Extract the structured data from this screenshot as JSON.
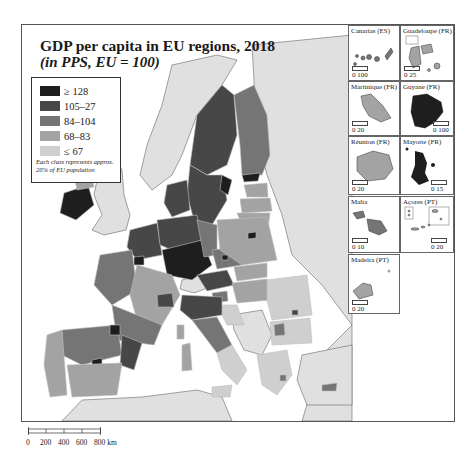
{
  "map": {
    "title": "GDP per capita in EU regions, 2018",
    "subtitle": "(in PPS, EU = 100)",
    "legend": {
      "classes": [
        {
          "label": "≥ 128",
          "color": "#1e1e1e"
        },
        {
          "label": "105–27",
          "color": "#474747"
        },
        {
          "label": "84–104",
          "color": "#757575"
        },
        {
          "label": "68–83",
          "color": "#a3a3a3"
        },
        {
          "label": "≤ 67",
          "color": "#cfcfcf"
        }
      ],
      "note": "Each class represents approx. 20% of EU population"
    },
    "non_eu_color": "#e0e0e0",
    "sea_color": "#ffffff",
    "insets": [
      {
        "name": "Canarias (ES)",
        "scale_label": "0 100",
        "fill": "#757575"
      },
      {
        "name": "Guadeloupe (FR)",
        "scale_label": "0 25",
        "fill": "#a3a3a3"
      },
      {
        "name": "Martinique (FR)",
        "scale_label": "0 20",
        "fill": "#a3a3a3"
      },
      {
        "name": "Guyane (FR)",
        "scale_label": "0 100",
        "fill": "#1e1e1e"
      },
      {
        "name": "Réunion (FR)",
        "scale_label": "0 20",
        "fill": "#a3a3a3"
      },
      {
        "name": "Mayotte (FR)",
        "scale_label": "0 15",
        "fill": "#1e1e1e"
      },
      {
        "name": "Malta",
        "scale_label": "0 10",
        "fill": "#757575"
      },
      {
        "name": "Açores (PT)",
        "scale_label": "0 20",
        "fill": "#a3a3a3"
      },
      {
        "name": "Madeira (PT)",
        "scale_label": "0 20",
        "fill": "#a3a3a3"
      }
    ],
    "scalebar": {
      "ticks": [
        "0",
        "200",
        "400",
        "600",
        "800 km"
      ]
    }
  }
}
